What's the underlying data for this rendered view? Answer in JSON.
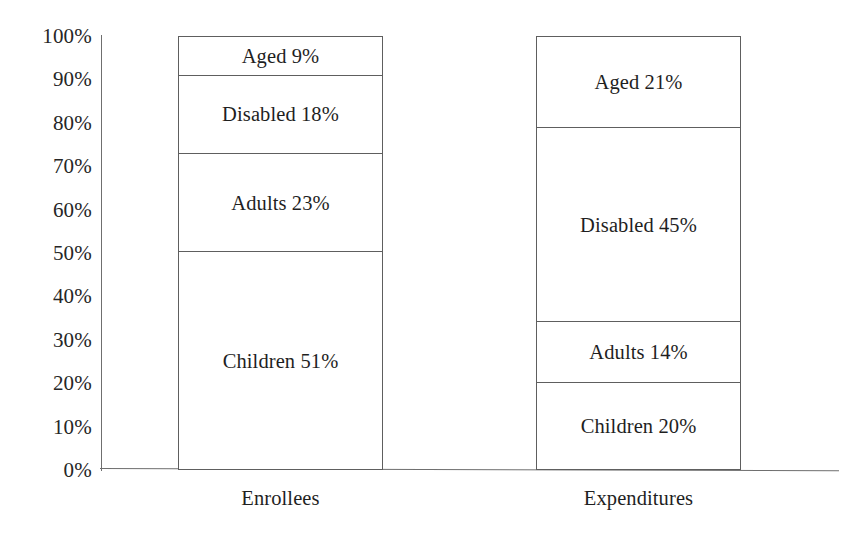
{
  "chart_data": {
    "type": "bar",
    "subtype": "100% stacked bar",
    "title": "",
    "xlabel": "",
    "ylabel": "",
    "ylim": [
      0,
      100
    ],
    "grid": false,
    "legend": "none (in-segment data labels)",
    "categories": [
      "Enrollees",
      "Expenditures"
    ],
    "y_ticks": [
      "0%",
      "10%",
      "20%",
      "30%",
      "40%",
      "50%",
      "60%",
      "70%",
      "80%",
      "90%",
      "100%"
    ],
    "y_tick_values": [
      0,
      10,
      20,
      30,
      40,
      50,
      60,
      70,
      80,
      90,
      100
    ],
    "stack_order_bottom_to_top": [
      "Children",
      "Adults",
      "Disabled",
      "Aged"
    ],
    "series": [
      {
        "name": "Children",
        "values": [
          51,
          20
        ]
      },
      {
        "name": "Adults",
        "values": [
          23,
          14
        ]
      },
      {
        "name": "Disabled",
        "values": [
          18,
          45
        ]
      },
      {
        "name": "Aged",
        "values": [
          21,
          21
        ]
      }
    ],
    "bars": [
      {
        "category": "Enrollees",
        "segments_top_to_bottom": [
          {
            "name": "Aged",
            "value": 9,
            "label": "Aged 9%"
          },
          {
            "name": "Disabled",
            "value": 18,
            "label": "Disabled 18%"
          },
          {
            "name": "Adults",
            "value": 23,
            "label": "Adults 23%"
          },
          {
            "name": "Children",
            "value": 51,
            "label": "Children 51%"
          }
        ]
      },
      {
        "category": "Expenditures",
        "segments_top_to_bottom": [
          {
            "name": "Aged",
            "value": 21,
            "label": "Aged 21%"
          },
          {
            "name": "Disabled",
            "value": 45,
            "label": "Disabled 45%"
          },
          {
            "name": "Adults",
            "value": 14,
            "label": "Adults 14%"
          },
          {
            "name": "Children",
            "value": 20,
            "label": "Children 20%"
          }
        ]
      }
    ],
    "colors": {
      "background": "#ffffff",
      "outline": "#5e5e5e",
      "axis": "#6f6f6f",
      "text": "#1f1f1f",
      "segment_fill": "#ffffff"
    }
  },
  "axis": {
    "y_ticks": [
      {
        "label": "100%",
        "value": 100
      },
      {
        "label": "90%",
        "value": 90
      },
      {
        "label": "80%",
        "value": 80
      },
      {
        "label": "70%",
        "value": 70
      },
      {
        "label": "60%",
        "value": 60
      },
      {
        "label": "50%",
        "value": 50
      },
      {
        "label": "40%",
        "value": 40
      },
      {
        "label": "30%",
        "value": 30
      },
      {
        "label": "20%",
        "value": 20
      },
      {
        "label": "10%",
        "value": 10
      },
      {
        "label": "0%",
        "value": 0
      }
    ]
  },
  "categories": [
    {
      "label": "Enrollees"
    },
    {
      "label": "Expenditures"
    }
  ]
}
